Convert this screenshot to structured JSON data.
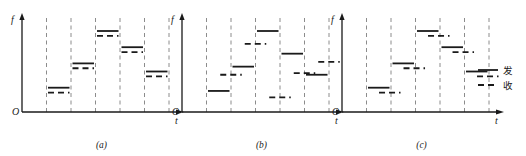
{
  "figure": {
    "title": "",
    "axis": {
      "y_label": "f",
      "x_label": "t",
      "origin_label": "O"
    },
    "legend": {
      "items": [
        {
          "label": "发",
          "style": "solid",
          "name": "transmit"
        },
        {
          "label": "收",
          "style": "dashed",
          "name": "receive"
        }
      ]
    },
    "panels": [
      {
        "caption": "(a)"
      },
      {
        "caption": "(b)"
      },
      {
        "caption": "(c)"
      }
    ]
  },
  "chart_data": {
    "type": "line",
    "title": "",
    "xlabel": "t",
    "ylabel": "f",
    "grid": "vertical-dashed",
    "legend_position": "right",
    "xlim": [
      0,
      6
    ],
    "ylim": [
      0,
      6
    ],
    "panels": [
      {
        "id": "a",
        "caption": "(a)",
        "description": "Transmit and receive hop at the same frequency and the same slot boundaries",
        "slots": [
          1,
          2,
          3,
          4,
          5
        ],
        "series": [
          {
            "name": "发",
            "style": "solid",
            "values": [
              1.5,
              3.0,
              5.0,
              4.0,
              2.5
            ],
            "x_offset": 0.0
          },
          {
            "name": "收",
            "style": "dashed",
            "values": [
              1.2,
              2.7,
              4.7,
              3.7,
              2.2
            ],
            "x_offset": 0.0
          }
        ]
      },
      {
        "id": "b",
        "caption": "(b)",
        "description": "Transmit and receive use independent frequencies and are offset by half a slot",
        "slots": [
          1,
          2,
          3,
          4,
          5
        ],
        "series": [
          {
            "name": "发",
            "style": "solid",
            "values": [
              1.3,
              2.8,
              5.0,
              3.6,
              2.3
            ],
            "x_offset": 0.0
          },
          {
            "name": "收",
            "style": "dashed",
            "values": [
              2.3,
              4.2,
              0.9,
              2.4,
              3.1
            ],
            "x_offset": 0.5
          }
        ]
      },
      {
        "id": "c",
        "caption": "(c)",
        "description": "Receive repeats the transmit frequency pattern delayed by part of a slot",
        "slots": [
          1,
          2,
          3,
          4,
          5
        ],
        "series": [
          {
            "name": "发",
            "style": "solid",
            "values": [
              1.5,
              3.0,
              5.0,
              4.0,
              2.5
            ],
            "x_offset": 0.0
          },
          {
            "name": "收",
            "style": "dashed",
            "values": [
              1.2,
              2.7,
              4.7,
              3.7,
              2.2
            ],
            "x_offset": 0.45
          }
        ]
      }
    ],
    "colors": {
      "line": "#1a1a1a",
      "grid": "#8c8c8c",
      "axis": "#1a1a1a"
    }
  }
}
